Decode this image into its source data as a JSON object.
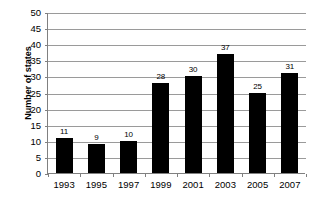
{
  "chart_data": {
    "type": "bar",
    "title": "",
    "subtitle": "",
    "xlabel": "",
    "ylabel": "Number of states",
    "categories": [
      "1993",
      "1995",
      "1997",
      "1999",
      "2001",
      "2003",
      "2005",
      "2007"
    ],
    "values": [
      11,
      9,
      10,
      28,
      30,
      37,
      25,
      31
    ],
    "data_labels": [
      "11",
      "9",
      "10",
      "28",
      "30",
      "37",
      "25",
      "31"
    ],
    "ylim": [
      0,
      50
    ],
    "ytick_step": 5,
    "ytick_labels": [
      "0",
      "5",
      "10",
      "15",
      "20",
      "25",
      "30",
      "35",
      "40",
      "45",
      "50"
    ],
    "ytick_values": [
      0,
      5,
      10,
      15,
      20,
      25,
      30,
      35,
      40,
      45,
      50
    ],
    "grid": "horizontal",
    "legend": "none",
    "series": [
      {
        "name": "Number of states",
        "values": [
          11,
          9,
          10,
          28,
          30,
          37,
          25,
          31
        ]
      }
    ],
    "colors": {
      "bar": "#000000",
      "gridline": "#9a9a9a",
      "axis": "#808080",
      "text": "#000000",
      "background": "#ffffff"
    }
  }
}
